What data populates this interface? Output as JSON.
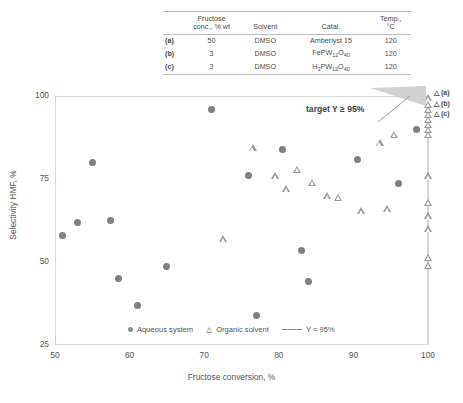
{
  "table": {
    "headers": [
      "",
      "Fructose conc., % wt",
      "Solvent",
      "Catal.",
      "Temp., °C"
    ],
    "header_conc_line1": "Fructose",
    "header_conc_line2": "conc., % wt",
    "header_solvent": "Solvent",
    "header_catalyst": "Catal.",
    "header_temp_line1": "Temp.,",
    "header_temp_line2": "°C",
    "rows": [
      {
        "label": "(a)",
        "conc": "50",
        "solvent": "DMSO",
        "catalyst": "Amberlyst 15",
        "catalyst_parts": {
          "pre": "Amberlyst 15",
          "sub1": "",
          "mid": "",
          "sub2": ""
        },
        "temp": "120"
      },
      {
        "label": "(b)",
        "conc": "3",
        "solvent": "DMSO",
        "catalyst": "FePW12O40",
        "catalyst_parts": {
          "pre": "FePW",
          "sub1": "12",
          "mid": "O",
          "sub2": "40"
        },
        "temp": "120"
      },
      {
        "label": "(c)",
        "conc": "3",
        "solvent": "DMSO",
        "catalyst": "H3PW12O40",
        "catalyst_parts": {
          "pre": "H",
          "sub0": "3",
          "mid0": "PW",
          "sub1": "12",
          "mid": "O",
          "sub2": "40"
        },
        "temp": "120"
      }
    ]
  },
  "annotation": {
    "target_text": "target Y ≥ 95%",
    "point_labels": [
      "△ (a)",
      "△ (b)",
      "△ (c)"
    ]
  },
  "legend": {
    "aqueous": "Aqueous system",
    "organic": "Organic solvent",
    "refline": "Y = 95%"
  },
  "colors": {
    "circle": "#808080",
    "triangle": "#9a9a9a",
    "refline": "#cfcfcf",
    "frame": "#d9d9d9",
    "text": "#555555",
    "wedge": "#c9c9c9"
  },
  "chart_data": {
    "type": "scatter",
    "title": "",
    "xlabel": "Fructose conversion, %",
    "ylabel": "Selectivity HMF, %",
    "xlim": [
      50,
      100
    ],
    "ylim": [
      25,
      100
    ],
    "xticks": [
      50,
      60,
      70,
      80,
      90,
      100
    ],
    "yticks": [
      25,
      50,
      75,
      100
    ],
    "grid": false,
    "legend_position": "bottom-center",
    "reference_lines": [
      {
        "name": "Y = 95%",
        "orientation": "vertical",
        "x": 100,
        "label": "Y = 95%"
      }
    ],
    "series": [
      {
        "name": "Aqueous system",
        "marker": "filled-circle",
        "color": "#808080",
        "points": [
          {
            "x": 51.0,
            "y": 58.0
          },
          {
            "x": 53.0,
            "y": 62.0
          },
          {
            "x": 55.0,
            "y": 80.0
          },
          {
            "x": 57.5,
            "y": 62.5
          },
          {
            "x": 58.5,
            "y": 45.0
          },
          {
            "x": 61.0,
            "y": 37.0
          },
          {
            "x": 65.0,
            "y": 48.5
          },
          {
            "x": 71.0,
            "y": 96.0
          },
          {
            "x": 76.0,
            "y": 76.0
          },
          {
            "x": 77.0,
            "y": 34.0
          },
          {
            "x": 80.5,
            "y": 84.0
          },
          {
            "x": 83.0,
            "y": 53.5
          },
          {
            "x": 84.0,
            "y": 44.0
          },
          {
            "x": 90.5,
            "y": 81.0
          },
          {
            "x": 96.0,
            "y": 73.5
          },
          {
            "x": 98.5,
            "y": 90.0
          }
        ]
      },
      {
        "name": "Organic solvent",
        "marker": "open-triangle",
        "color": "#9a9a9a",
        "points": [
          {
            "x": 72.5,
            "y": 57.0
          },
          {
            "x": 76.5,
            "y": 84.5
          },
          {
            "x": 79.5,
            "y": 76.0
          },
          {
            "x": 81.0,
            "y": 72.0
          },
          {
            "x": 82.5,
            "y": 78.0
          },
          {
            "x": 84.5,
            "y": 74.0
          },
          {
            "x": 86.5,
            "y": 70.0
          },
          {
            "x": 88.0,
            "y": 69.5
          },
          {
            "x": 91.0,
            "y": 65.5
          },
          {
            "x": 93.5,
            "y": 86.0
          },
          {
            "x": 94.5,
            "y": 66.0
          },
          {
            "x": 95.5,
            "y": 88.5
          },
          {
            "x": 100.0,
            "y": 99.5
          },
          {
            "x": 100.0,
            "y": 97.5
          },
          {
            "x": 100.0,
            "y": 96.0
          },
          {
            "x": 100.0,
            "y": 94.5
          },
          {
            "x": 100.0,
            "y": 93.0
          },
          {
            "x": 100.0,
            "y": 91.5
          },
          {
            "x": 100.0,
            "y": 90.0
          },
          {
            "x": 100.0,
            "y": 88.5
          },
          {
            "x": 100.0,
            "y": 76.0
          },
          {
            "x": 100.0,
            "y": 68.0
          },
          {
            "x": 100.0,
            "y": 64.0
          },
          {
            "x": 100.0,
            "y": 60.0
          },
          {
            "x": 100.0,
            "y": 51.5
          },
          {
            "x": 100.0,
            "y": 49.0
          }
        ]
      }
    ]
  }
}
